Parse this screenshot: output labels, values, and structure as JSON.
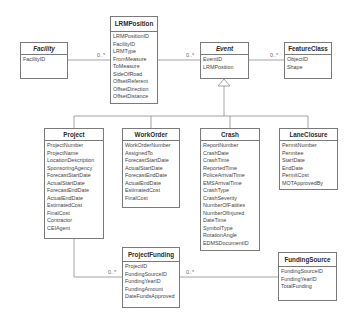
{
  "classes": {
    "facility": {
      "name": "Facility",
      "abstract": true,
      "attributes": [
        "FacilityID"
      ]
    },
    "lrmposition": {
      "name": "LRMPosition",
      "abstract": false,
      "attributes": [
        "LRMPositionID",
        "FacilityID",
        "LRMType",
        "FromMeasure",
        "ToMeasure",
        "SideOfRoad",
        "OffsetReferent",
        "OffsetDirection",
        "OffsetDistance"
      ]
    },
    "event": {
      "name": "Event",
      "abstract": true,
      "attributes": [
        "EventID",
        "LRMPosition"
      ]
    },
    "featureclass": {
      "name": "FeatureClass",
      "abstract": false,
      "attributes": [
        "ObjectID",
        "Shape"
      ]
    },
    "project": {
      "name": "Project",
      "abstract": false,
      "attributes": [
        "ProjectNumber",
        "ProjectName",
        "LocationDescription",
        "SponsoringAgency",
        "ForecastStartDate",
        "ActualStartDate",
        "ForecastEndDate",
        "ActualEndDate",
        "EstimatedCost",
        "FinalCost",
        "Contractor",
        "CEIAgent"
      ]
    },
    "workorder": {
      "name": "WorkOrder",
      "abstract": false,
      "attributes": [
        "WorkOrderNumber",
        "AssignedTo",
        "ForecastStartDate",
        "ActualStartDate",
        "ForecastEndDate",
        "ActualEndDate",
        "EstimatedCost",
        "FinalCost"
      ]
    },
    "crash": {
      "name": "Crash",
      "abstract": false,
      "attributes": [
        "ReportNumber",
        "CrashDate",
        "CrashTime",
        "ReportedTime",
        "PoliceArrivalTime",
        "EMSArrivalTime",
        "CrashType",
        "CrashSeverity",
        "NumberOfFatities",
        "NumberOfInjured",
        "DateTime",
        "SymbolType",
        "RotationAngle",
        "EDMSDocumentID"
      ]
    },
    "laneclosure": {
      "name": "LaneClosure",
      "abstract": false,
      "attributes": [
        "PermitNumber",
        "Permitee",
        "StartDate",
        "EndDate",
        "PermitCost",
        "MOTApprovedBy"
      ]
    },
    "projectfunding": {
      "name": "ProjectFunding",
      "abstract": false,
      "attributes": [
        "ProjectID",
        "FundingSourceID",
        "FundingYearID",
        "FundingAmount",
        "DateFundsApproved"
      ]
    },
    "fundingsource": {
      "name": "FundingSource",
      "abstract": false,
      "attributes": [
        "FundingSourceID",
        "FundingYearID",
        "TotalFunding"
      ]
    }
  },
  "multiplicities": {
    "facility_lrm": "0..*",
    "lrm_event": "0..*",
    "event_feature": "0..*",
    "project_funding": "0..*",
    "funding_source": "0..*"
  },
  "colors": {
    "line": "#8a8a8a",
    "border": "#7a7a7a",
    "text": "#444444"
  }
}
